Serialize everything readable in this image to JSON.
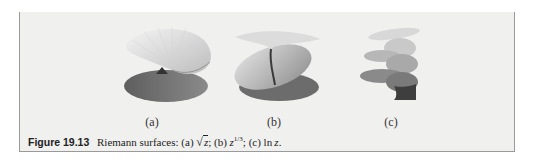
{
  "figure": {
    "number": "Figure 19.13",
    "caption_prefix": "Riemann surfaces:",
    "parts": [
      {
        "label": "(a)",
        "caption_label": "(a)",
        "expression": "√z",
        "radicand": "z"
      },
      {
        "label": "(b)",
        "caption_label": "(b)",
        "expression": "z^(1/3)",
        "base": "z",
        "exponent": "1/3"
      },
      {
        "label": "(c)",
        "caption_label": "(c)",
        "expression": "ln z",
        "func": "ln",
        "arg": "z"
      }
    ],
    "separator": ";",
    "terminator": "."
  },
  "colors": {
    "box_background": "#f0f0ef",
    "box_border": "#9a9a9a",
    "surface_light": "#e6e6e6",
    "surface_mid": "#b5b5b5",
    "surface_dark": "#6f6f6f"
  }
}
